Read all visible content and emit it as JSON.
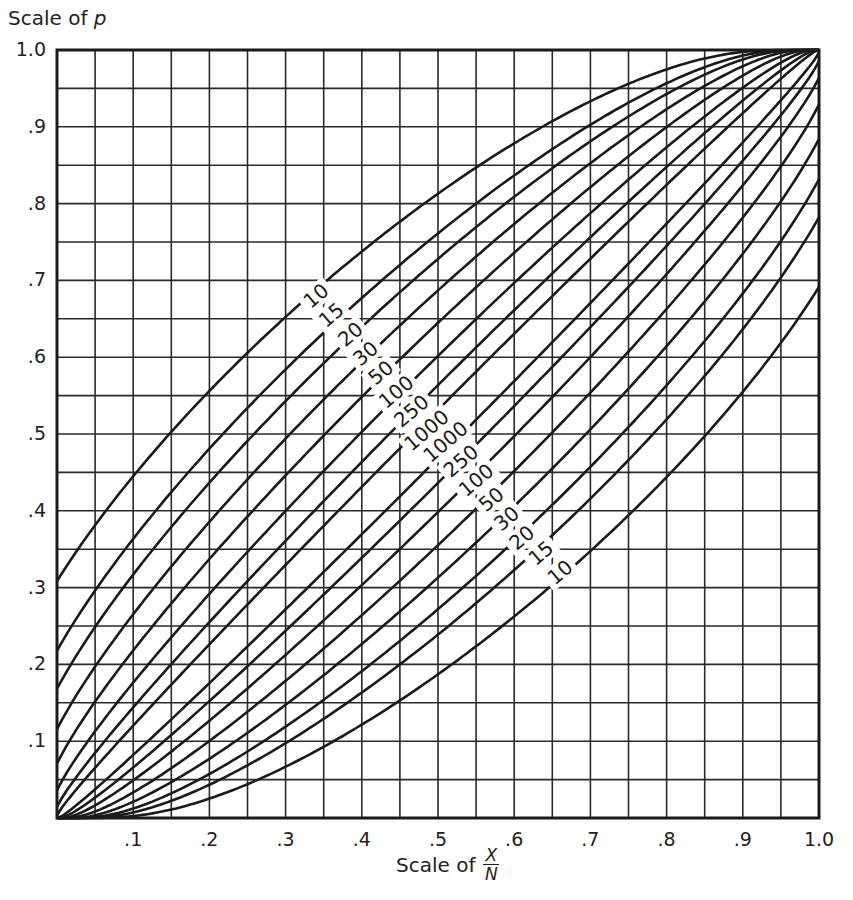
{
  "chart_data": {
    "type": "line",
    "title": "",
    "xlabel": "Scale of X/N",
    "ylabel": "Scale of p",
    "xlim": [
      0,
      1
    ],
    "ylim": [
      0,
      1
    ],
    "grid": true,
    "grid_step": 0.05,
    "x_ticks": [
      ".1",
      ".2",
      ".3",
      ".4",
      ".5",
      ".6",
      ".7",
      ".8",
      ".9",
      "1.0"
    ],
    "y_ticks": [
      ".1",
      ".2",
      ".3",
      ".4",
      ".5",
      ".6",
      ".7",
      ".8",
      ".9",
      "1.0"
    ],
    "confidence_level": 0.95,
    "series_sample_sizes": [
      10,
      15,
      20,
      30,
      50,
      100,
      250,
      1000
    ],
    "upper_labels_order": [
      "10",
      "15",
      "20",
      "30",
      "50",
      "100",
      "250",
      "1000"
    ],
    "lower_labels_order": [
      "1000",
      "250",
      "100",
      "50",
      "30",
      "20",
      "15",
      "10"
    ],
    "upper_limit_at_x0": {
      "10": 0.31,
      "15": 0.22,
      "20": 0.17,
      "30": 0.12,
      "50": 0.07,
      "100": 0.036,
      "250": 0.015,
      "1000": 0.004
    },
    "lower_limit_at_x1": {
      "10": 0.69,
      "15": 0.78,
      "20": 0.83,
      "30": 0.88,
      "50": 0.93,
      "100": 0.964,
      "250": 0.985,
      "1000": 0.996
    },
    "series": [
      {
        "name": "N=10 upper",
        "points": [
          [
            0,
            0.31
          ],
          [
            0.1,
            0.45
          ],
          [
            0.2,
            0.56
          ],
          [
            0.3,
            0.65
          ],
          [
            0.4,
            0.74
          ],
          [
            0.5,
            0.81
          ],
          [
            0.6,
            0.88
          ],
          [
            0.7,
            0.93
          ],
          [
            0.8,
            0.97
          ],
          [
            0.9,
            0.99
          ],
          [
            1.0,
            1.0
          ]
        ]
      },
      {
        "name": "N=10 lower",
        "points": [
          [
            0,
            0
          ],
          [
            0.1,
            0.01
          ],
          [
            0.2,
            0.03
          ],
          [
            0.3,
            0.07
          ],
          [
            0.4,
            0.12
          ],
          [
            0.5,
            0.19
          ],
          [
            0.6,
            0.26
          ],
          [
            0.7,
            0.35
          ],
          [
            0.8,
            0.44
          ],
          [
            0.9,
            0.55
          ],
          [
            1.0,
            0.69
          ]
        ]
      },
      {
        "name": "N=1000 upper",
        "points": [
          [
            0,
            0.004
          ],
          [
            0.5,
            0.53
          ],
          [
            1.0,
            1.0
          ]
        ]
      },
      {
        "name": "N=1000 lower",
        "points": [
          [
            0,
            0
          ],
          [
            0.5,
            0.47
          ],
          [
            1.0,
            0.996
          ]
        ]
      }
    ],
    "label_positions": {
      "upper": [
        [
          0.34,
          0.68
        ],
        [
          0.36,
          0.655
        ],
        [
          0.385,
          0.63
        ],
        [
          0.405,
          0.605
        ],
        [
          0.425,
          0.58
        ],
        [
          0.445,
          0.555
        ],
        [
          0.465,
          0.53
        ],
        [
          0.485,
          0.505
        ]
      ],
      "lower": [
        [
          0.51,
          0.49
        ],
        [
          0.53,
          0.465
        ],
        [
          0.55,
          0.44
        ],
        [
          0.57,
          0.415
        ],
        [
          0.59,
          0.39
        ],
        [
          0.61,
          0.365
        ],
        [
          0.635,
          0.345
        ],
        [
          0.66,
          0.32
        ]
      ]
    }
  },
  "axes": {
    "y_title_prefix": "Scale of ",
    "y_title_symbol": "p",
    "x_title_prefix": "Scale of",
    "x_title_num": "X",
    "x_title_den": "N"
  },
  "colors": {
    "ink": "#1a1a1a",
    "grid": "#2a2a2a",
    "background": "#ffffff"
  }
}
